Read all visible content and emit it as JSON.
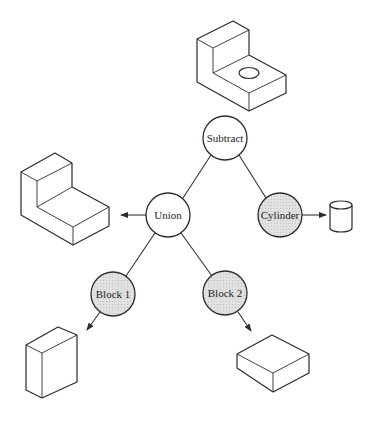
{
  "diagram": {
    "colors": {
      "operation_fill": "#ffffff",
      "primitive_fill": "#dcdcdc",
      "stroke": "#2b2b2b"
    },
    "nodes": [
      {
        "id": "subtract",
        "label": "Subtract",
        "kind": "operation",
        "result_shape": "L-bracket-with-hole"
      },
      {
        "id": "union",
        "label": "Union",
        "kind": "operation",
        "result_shape": "L-bracket"
      },
      {
        "id": "cylinder",
        "label": "Cylinder",
        "kind": "primitive",
        "result_shape": "cylinder"
      },
      {
        "id": "block1",
        "label": "Block 1",
        "kind": "primitive",
        "result_shape": "tall-block"
      },
      {
        "id": "block2",
        "label": "Block 2",
        "kind": "primitive",
        "result_shape": "flat-block"
      }
    ],
    "edges": [
      {
        "from": "subtract",
        "to": "union"
      },
      {
        "from": "subtract",
        "to": "cylinder"
      },
      {
        "from": "union",
        "to": "block1"
      },
      {
        "from": "union",
        "to": "block2"
      }
    ]
  }
}
